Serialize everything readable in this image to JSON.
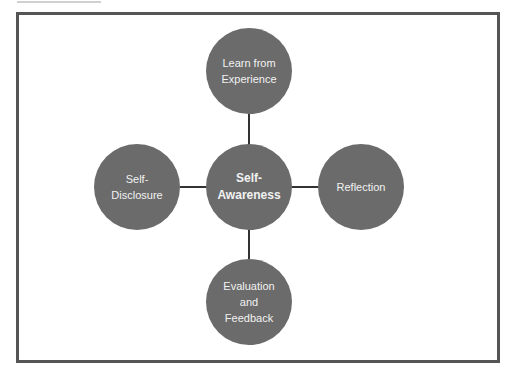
{
  "diagram": {
    "center": {
      "label": "Self-\nAwareness"
    },
    "nodes": [
      {
        "position": "top",
        "label": "Learn from\nExperience"
      },
      {
        "position": "left",
        "label": "Self-\nDisclosure"
      },
      {
        "position": "right",
        "label": "Reflection"
      },
      {
        "position": "bottom",
        "label": "Evaluation\nand\nFeedback"
      }
    ]
  },
  "colors": {
    "node_fill": "#6b6b6b",
    "node_text": "#f2f2f2",
    "frame_border": "#555555",
    "connector": "#333333"
  }
}
